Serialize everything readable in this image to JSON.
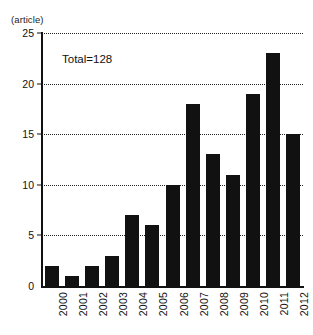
{
  "chart_data": {
    "type": "bar",
    "title": "",
    "xlabel": "",
    "ylabel": "(article)",
    "ylim": [
      0,
      25
    ],
    "yticks": [
      0,
      5,
      10,
      15,
      20,
      25
    ],
    "grid": true,
    "legend": "none",
    "annotation": "Total=128",
    "bar_color": "#111111",
    "categories": [
      "2000",
      "2001",
      "2002",
      "2003",
      "2004",
      "2005",
      "2006",
      "2007",
      "2008",
      "2009",
      "2010",
      "2011",
      "2012"
    ],
    "values": [
      2,
      1,
      2,
      3,
      7,
      6,
      10,
      18,
      13,
      11,
      19,
      23,
      15
    ]
  }
}
